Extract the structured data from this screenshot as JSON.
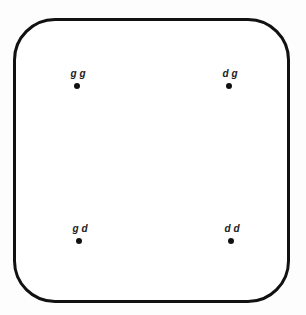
{
  "diagram": {
    "points": [
      {
        "label": "g g",
        "x": 77,
        "y": 86
      },
      {
        "label": "d g",
        "x": 229,
        "y": 86
      },
      {
        "label": "g d",
        "x": 79,
        "y": 241
      },
      {
        "label": "d d",
        "x": 231,
        "y": 241
      }
    ]
  }
}
